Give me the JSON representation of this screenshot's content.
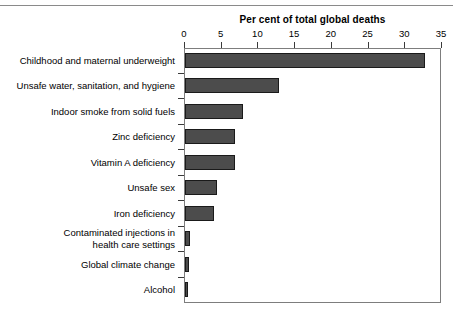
{
  "figure": {
    "rule_top": true,
    "background": "#ffffff",
    "bar_fill": "#4c4c4c",
    "bar_border": "#1a1a1a",
    "frame_color": "#7d7d7d"
  },
  "chart_data": {
    "type": "bar",
    "orientation": "horizontal",
    "title": "",
    "xlabel": "Per cent of total global deaths",
    "ylabel": "",
    "xlim": [
      0,
      35
    ],
    "ylim": null,
    "grid": false,
    "legend": null,
    "xticks": [
      0,
      5,
      10,
      15,
      20,
      25,
      30,
      35
    ],
    "xtick_labels": [
      "0",
      "5",
      "10",
      "15",
      "20",
      "25",
      "30",
      "35"
    ],
    "categories": [
      "Childhood and maternal underweight",
      "Unsafe water, sanitation, and hygiene",
      "Indoor smoke from solid fuels",
      "Zinc deficiency",
      "Vitamin A deficiency",
      "Unsafe sex",
      "Iron deficiency",
      "Contaminated injections in\nhealth care settings",
      "Global climate change",
      "Alcohol"
    ],
    "values": [
      32.8,
      12.8,
      7.9,
      6.8,
      6.8,
      4.4,
      4.0,
      0.7,
      0.6,
      0.4
    ]
  }
}
